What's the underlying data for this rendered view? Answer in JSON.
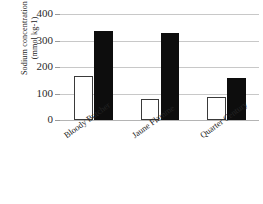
{
  "chart_data": {
    "type": "bar",
    "title": "",
    "xlabel": "",
    "ylabel": "Sodium concentration (mmol kg-1)",
    "ylabel_line1": "Sodium concentration",
    "ylabel_line2": "(mmol kg-1)",
    "categories": [
      "Bloody Butcher",
      "Jaune Flamme",
      "Quarter Century"
    ],
    "series": [
      {
        "name": "white",
        "fill": "#ffffff",
        "values": [
          165,
          80,
          88
        ]
      },
      {
        "name": "black",
        "fill": "#0d0d0d",
        "values": [
          335,
          327,
          160
        ]
      }
    ],
    "ylim": [
      0,
      400
    ],
    "yticks": [
      0,
      100,
      200,
      300,
      400
    ],
    "ytick_labels": [
      "0",
      "100",
      "200",
      "300",
      "400"
    ],
    "grid": true,
    "legend": "none",
    "axis_color": "#c8c8c8"
  }
}
